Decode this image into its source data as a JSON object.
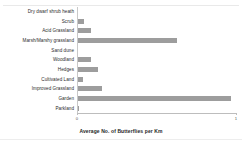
{
  "chart_data": {
    "type": "bar",
    "orientation": "horizontal",
    "title": "",
    "xlabel": "Average No. of Butterflies per Km",
    "ylabel": "",
    "categories": [
      "Dry dwarf shrub heath",
      "Scrub",
      "Acid Grassland",
      "Marsh/Marshy grassland",
      "Sand dune",
      "Woodland",
      "Hedges",
      "Cultivated Land",
      "Improved Grassland",
      "Garden",
      "Parkland"
    ],
    "values": [
      0.2,
      4.5,
      8.5,
      63.0,
      0.4,
      9.0,
      13.0,
      3.8,
      16.0,
      97.0,
      1.2
    ],
    "xlim": [
      0,
      100
    ],
    "xticks": [
      0,
      100
    ],
    "xtick_labels": [
      "0",
      "1"
    ],
    "grid": false,
    "legend": false,
    "bar_color": "#9d9d9d"
  },
  "axis": {
    "x_title": "Average No. of Butterflies per Km",
    "tick_left": "0",
    "tick_right": "1"
  }
}
